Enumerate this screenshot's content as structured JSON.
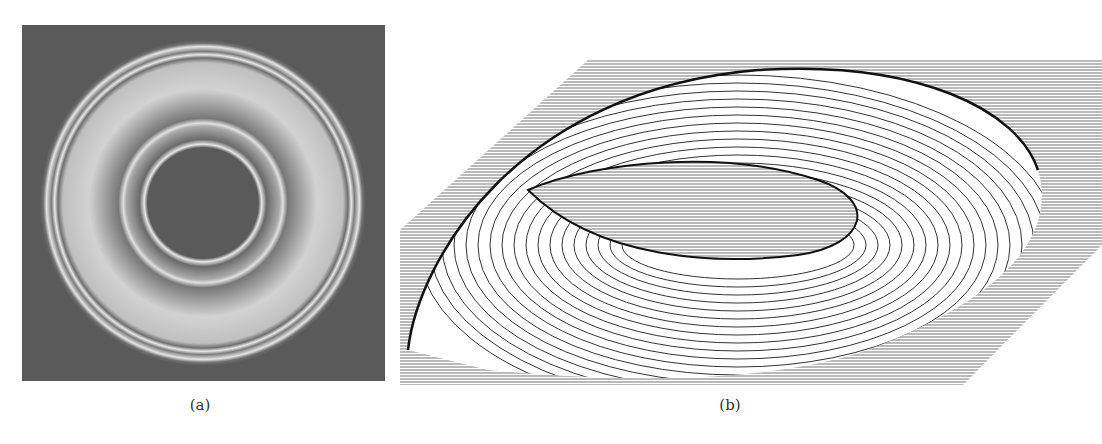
{
  "figure": {
    "panels": [
      {
        "id": "a",
        "caption": "(a)",
        "description": "Interference fringe pattern with concentric rings on dark background",
        "colors": {
          "background": "#5a5a5a",
          "ring_light": "#d8d8d8",
          "core": "#555555"
        }
      },
      {
        "id": "b",
        "caption": "(b)",
        "description": "3D line-drawn surface plot of a torus-shaped height profile on a hatched base plane",
        "colors": {
          "line": "#222222",
          "hatch": "#888888",
          "paper": "#ffffff"
        }
      }
    ]
  }
}
